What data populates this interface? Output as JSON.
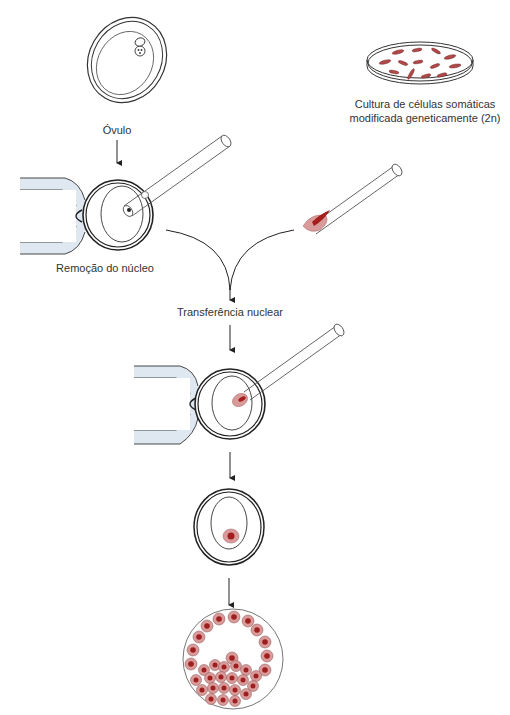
{
  "labels": {
    "ovulo": "Óvulo",
    "culture_line1": "Cultura de células somáticas",
    "culture_line2": "modificada geneticamente (2n)",
    "nucleus_removal": "Remoção do núcleo",
    "nuclear_transfer": "Transferência nuclear"
  },
  "colors": {
    "outline": "#222222",
    "holder_fill": "#dfe8f1",
    "cell_fill": "#d99a9a",
    "nucleus_fill": "#9e1f1f",
    "arrow": "#222222"
  },
  "steps": [
    {
      "id": "oocyte",
      "label_key": "ovulo"
    },
    {
      "id": "somatic-culture",
      "label_key": "culture_line1"
    },
    {
      "id": "enucleation",
      "label_key": "nucleus_removal"
    },
    {
      "id": "nuclear-transfer",
      "label_key": "nuclear_transfer"
    },
    {
      "id": "reconstructed-egg"
    },
    {
      "id": "blastocyst"
    }
  ]
}
